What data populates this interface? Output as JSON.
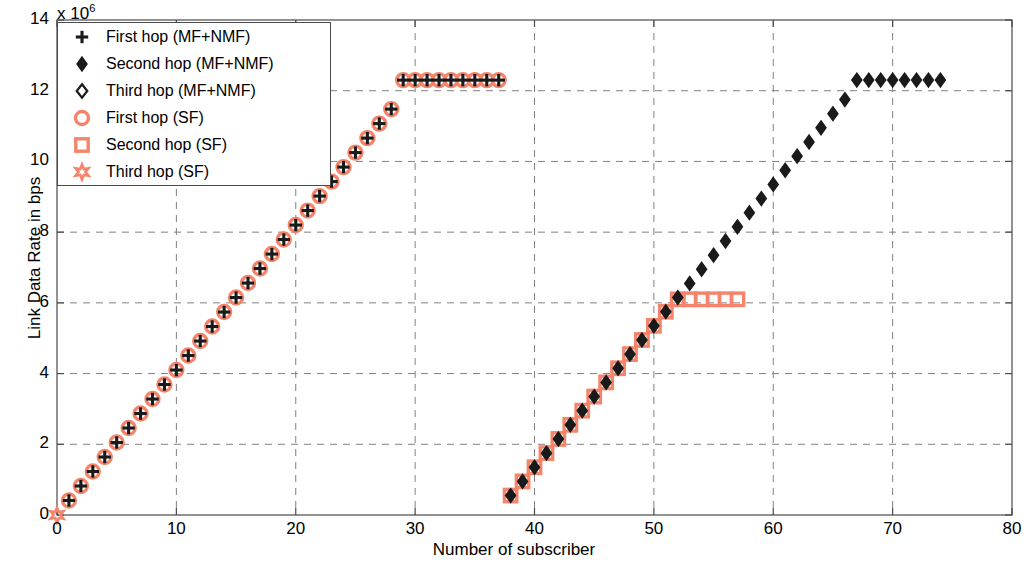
{
  "chart_data": {
    "type": "scatter",
    "title": "",
    "xlabel": "Number of subscriber",
    "ylabel": "Link Data Rate in bps",
    "y_exponent_label": "x 10",
    "y_exponent_power": "6",
    "xlim": [
      0,
      80
    ],
    "ylim": [
      0,
      14
    ],
    "xticks": [
      0,
      10,
      20,
      30,
      40,
      50,
      60,
      70,
      80
    ],
    "yticks": [
      0,
      2,
      4,
      6,
      8,
      10,
      12,
      14
    ],
    "xticklabels": [
      "0",
      "10",
      "20",
      "30",
      "40",
      "50",
      "60",
      "70",
      "80"
    ],
    "yticklabels": [
      "0",
      "2",
      "4",
      "6",
      "8",
      "10",
      "12",
      "14"
    ],
    "grid": true,
    "grid_style": "dashed",
    "grid_color": "#808080",
    "legend_position": "upper-left",
    "marker_colors": {
      "mf_nmf": "#1a1a1a",
      "sf": "#f4856b"
    },
    "series": [
      {
        "name": "First hop (MF+NMF)",
        "marker": "plus",
        "color": "#1a1a1a",
        "x": [
          1,
          2,
          3,
          4,
          5,
          6,
          7,
          8,
          9,
          10,
          11,
          12,
          13,
          14,
          15,
          16,
          17,
          18,
          19,
          20,
          21,
          22,
          23,
          24,
          25,
          26,
          27,
          28,
          29,
          30,
          31,
          32,
          33,
          34,
          35,
          36,
          37
        ],
        "y": [
          0.41,
          0.82,
          1.23,
          1.64,
          2.05,
          2.46,
          2.87,
          3.28,
          3.69,
          4.1,
          4.51,
          4.92,
          5.33,
          5.74,
          6.15,
          6.56,
          6.97,
          7.38,
          7.79,
          8.2,
          8.61,
          9.02,
          9.43,
          9.84,
          10.25,
          10.66,
          11.07,
          11.48,
          12.3,
          12.3,
          12.3,
          12.3,
          12.3,
          12.3,
          12.3,
          12.3,
          12.3
        ]
      },
      {
        "name": "Second hop (MF+NMF)",
        "marker": "diamond-filled",
        "color": "#1a1a1a",
        "x": [
          38,
          39,
          40,
          41,
          42,
          43,
          44,
          45,
          46,
          47,
          48,
          49,
          50,
          51,
          52,
          53,
          54,
          55,
          56,
          57,
          58,
          59,
          60,
          61,
          62,
          63,
          64,
          65,
          66,
          67,
          68,
          69,
          70,
          71,
          72,
          73,
          74
        ],
        "y": [
          0.55,
          0.95,
          1.35,
          1.75,
          2.15,
          2.55,
          2.95,
          3.35,
          3.75,
          4.15,
          4.55,
          4.95,
          5.35,
          5.75,
          6.15,
          6.55,
          6.95,
          7.35,
          7.75,
          8.15,
          8.55,
          8.95,
          9.35,
          9.75,
          10.15,
          10.55,
          10.95,
          11.35,
          11.75,
          12.3,
          12.3,
          12.3,
          12.3,
          12.3,
          12.3,
          12.3,
          12.3
        ]
      },
      {
        "name": "Third hop (MF+NMF)",
        "marker": "diamond-open",
        "color": "#1a1a1a",
        "x": [],
        "y": []
      },
      {
        "name": "First hop (SF)",
        "marker": "circle-open",
        "color": "#f4856b",
        "x": [
          1,
          2,
          3,
          4,
          5,
          6,
          7,
          8,
          9,
          10,
          11,
          12,
          13,
          14,
          15,
          16,
          17,
          18,
          19,
          20,
          21,
          22,
          23,
          24,
          25,
          26,
          27,
          28,
          29,
          30,
          31,
          32,
          33,
          34,
          35,
          36,
          37
        ],
        "y": [
          0.41,
          0.82,
          1.23,
          1.64,
          2.05,
          2.46,
          2.87,
          3.28,
          3.69,
          4.1,
          4.51,
          4.92,
          5.33,
          5.74,
          6.15,
          6.56,
          6.97,
          7.38,
          7.79,
          8.2,
          8.61,
          9.02,
          9.43,
          9.84,
          10.25,
          10.66,
          11.07,
          11.48,
          12.3,
          12.3,
          12.3,
          12.3,
          12.3,
          12.3,
          12.3,
          12.3,
          12.3
        ]
      },
      {
        "name": "Second hop (SF)",
        "marker": "square-open",
        "color": "#f4856b",
        "x": [
          38,
          39,
          40,
          41,
          42,
          43,
          44,
          45,
          46,
          47,
          48,
          49,
          50,
          51,
          52,
          53,
          54,
          55,
          56,
          57
        ],
        "y": [
          0.55,
          0.95,
          1.35,
          1.75,
          2.15,
          2.55,
          2.95,
          3.35,
          3.75,
          4.15,
          4.55,
          4.95,
          5.35,
          5.75,
          6.1,
          6.1,
          6.1,
          6.1,
          6.1,
          6.1
        ]
      },
      {
        "name": "Third hop (SF)",
        "marker": "star-open",
        "color": "#f4856b",
        "x": [
          0
        ],
        "y": [
          0
        ]
      }
    ]
  },
  "legend": {
    "entries": [
      {
        "label": "First hop (MF+NMF)",
        "marker": "plus",
        "color": "#1a1a1a"
      },
      {
        "label": "Second hop (MF+NMF)",
        "marker": "diamond-filled",
        "color": "#1a1a1a"
      },
      {
        "label": "Third hop (MF+NMF)",
        "marker": "diamond-open",
        "color": "#1a1a1a"
      },
      {
        "label": "First hop (SF)",
        "marker": "circle-open",
        "color": "#f4856b"
      },
      {
        "label": "Second hop (SF)",
        "marker": "square-open",
        "color": "#f4856b"
      },
      {
        "label": "Third hop (SF)",
        "marker": "star-open",
        "color": "#f4856b"
      }
    ]
  }
}
